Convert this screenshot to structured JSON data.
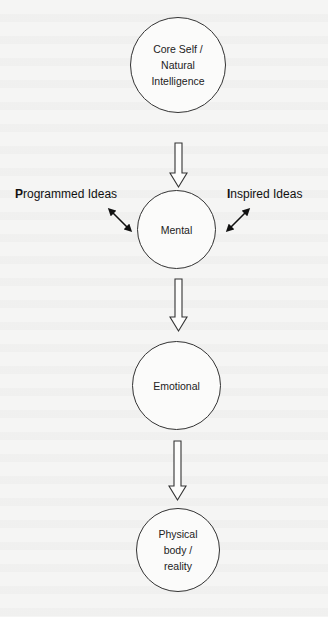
{
  "diagram": {
    "nodes": [
      {
        "id": "core",
        "label": "Core Self /\nNatural\nIntelligence"
      },
      {
        "id": "mental",
        "label": "Mental"
      },
      {
        "id": "emotional",
        "label": "Emotional"
      },
      {
        "id": "physical",
        "label": "Physical\nbody /\nreality"
      }
    ],
    "side_labels": {
      "left": {
        "initial": "P",
        "rest": "rogrammed Ideas"
      },
      "right": {
        "initial": "I",
        "rest": "nspired Ideas"
      }
    },
    "edges": [
      {
        "from": "core",
        "to": "mental",
        "style": "hollow-block-arrow"
      },
      {
        "from": "mental",
        "to": "emotional",
        "style": "hollow-block-arrow"
      },
      {
        "from": "emotional",
        "to": "physical",
        "style": "hollow-block-arrow"
      },
      {
        "from": "programmed-ideas",
        "to": "mental",
        "style": "double-headed-arrow"
      },
      {
        "from": "inspired-ideas",
        "to": "mental",
        "style": "double-headed-arrow"
      }
    ],
    "colors": {
      "stroke": "#333333",
      "background": "#f5f5f4",
      "text": "#222222"
    }
  }
}
